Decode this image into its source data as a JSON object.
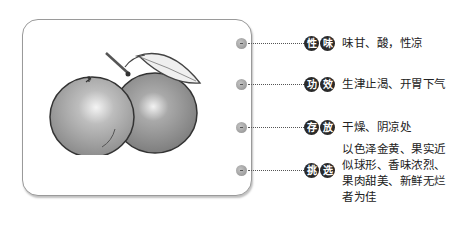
{
  "illustration": {
    "subject": "two oranges with stem and leaf",
    "icon": "orange-fruit-illustration"
  },
  "items": [
    {
      "badge": [
        "性",
        "味"
      ],
      "label": "性味",
      "text": "味甘、酸，性凉"
    },
    {
      "badge": [
        "功",
        "效"
      ],
      "label": "功效",
      "text": "生津止渴、开胃下气"
    },
    {
      "badge": [
        "存",
        "放"
      ],
      "label": "存放",
      "text": "干燥、阴凉处"
    },
    {
      "badge": [
        "挑",
        "选"
      ],
      "label": "挑选",
      "text": "以色泽金黄、果实近似球形、香味浓烈、果肉甜美、新鲜无烂者为佳"
    }
  ],
  "colors": {
    "badge_bg": "#2a2a2a",
    "badge_fg": "#ffffff",
    "frame_border": "#9a9a9a",
    "text": "#222222"
  }
}
